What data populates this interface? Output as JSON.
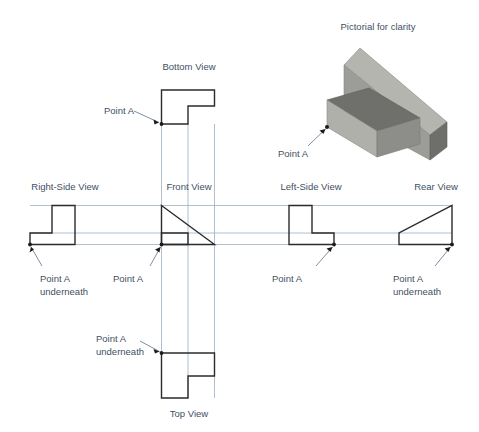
{
  "figure": {
    "pictorial_caption": "Pictorial for clarity",
    "point_label": "Point A",
    "point_underneath_line1": "Point A",
    "point_underneath_line2": "underneath",
    "colors": {
      "outline": "#2b2b2b",
      "projection_line": "#9dafc2",
      "text": "#3f5064",
      "leader": "#5d7287",
      "solid_top_face": "#b9b9b4",
      "solid_front_face": "#8e8e8a",
      "solid_side_face": "#6f6f6c",
      "background": "#ffffff"
    }
  },
  "views": {
    "bottom": {
      "label": "Bottom View"
    },
    "right_side": {
      "label": "Right-Side View"
    },
    "front": {
      "label": "Front View"
    },
    "left_side": {
      "label": "Left-Side View"
    },
    "rear": {
      "label": "Rear View"
    },
    "top": {
      "label": "Top View"
    }
  },
  "callouts": [
    {
      "id": "bottom-view-point-a",
      "line1": "Point A",
      "line2": ""
    },
    {
      "id": "pictorial-point-a",
      "line1": "Point A",
      "line2": ""
    },
    {
      "id": "right-side-point-a",
      "line1": "Point A",
      "line2": "underneath"
    },
    {
      "id": "front-view-point-a",
      "line1": "Point A",
      "line2": ""
    },
    {
      "id": "left-side-point-a",
      "line1": "Point A",
      "line2": ""
    },
    {
      "id": "rear-view-point-a",
      "line1": "Point A",
      "line2": "underneath"
    },
    {
      "id": "top-view-point-a",
      "line1": "Point A",
      "line2": "underneath"
    }
  ]
}
